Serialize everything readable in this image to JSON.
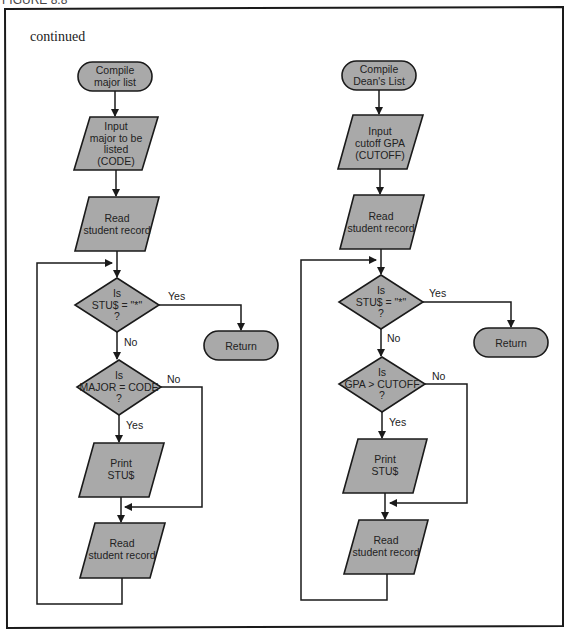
{
  "header": {
    "figure_label": "FIGURE 8.8"
  },
  "continued_label": "continued",
  "colors": {
    "shape_fill": "#a9a9a9",
    "stroke": "#1a1a1a",
    "background": "#ffffff"
  },
  "left_flowchart": {
    "start": {
      "line1": "Compile",
      "line2": "major list"
    },
    "input": {
      "line1": "Input",
      "line2": "major to be",
      "line3": "listed",
      "line4": "(CODE)"
    },
    "read1": {
      "line1": "Read",
      "line2": "student record"
    },
    "decision1": {
      "line1": "Is",
      "line2": "STU$  =  \"*\"",
      "line3": "?",
      "yes": "Yes",
      "no": "No"
    },
    "return": {
      "label": "Return"
    },
    "decision2": {
      "line1": "Is",
      "line2": "MAJOR = CODE",
      "line3": "?",
      "yes": "Yes",
      "no": "No"
    },
    "print": {
      "line1": "Print",
      "line2": "STU$"
    },
    "read2": {
      "line1": "Read",
      "line2": "student record"
    }
  },
  "right_flowchart": {
    "start": {
      "line1": "Compile",
      "line2": "Dean's List"
    },
    "input": {
      "line1": "Input",
      "line2": "cutoff GPA",
      "line3": "(CUTOFF)"
    },
    "read1": {
      "line1": "Read",
      "line2": "student record"
    },
    "decision1": {
      "line1": "Is",
      "line2": "STU$  =  \"*\"",
      "line3": "?",
      "yes": "Yes",
      "no": "No"
    },
    "return": {
      "label": "Return"
    },
    "decision2": {
      "line1": "Is",
      "line2": "GPA > CUTOFF",
      "line3": "?",
      "yes": "Yes",
      "no": "No"
    },
    "print": {
      "line1": "Print",
      "line2": "STU$"
    },
    "read2": {
      "line1": "Read",
      "line2": "student record"
    }
  }
}
